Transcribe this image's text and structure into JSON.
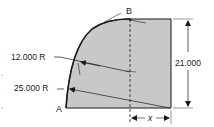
{
  "diagram": {
    "colors": {
      "fill": "#c8c8c8",
      "stroke": "#1a1a1a",
      "background": "#ffffff"
    },
    "points": {
      "a_label": "A",
      "b_label": "B"
    },
    "dimensions": {
      "height": "21.000",
      "small_radius": "12.000 R",
      "large_radius": "25.000 R",
      "unknown_width": "x"
    }
  }
}
